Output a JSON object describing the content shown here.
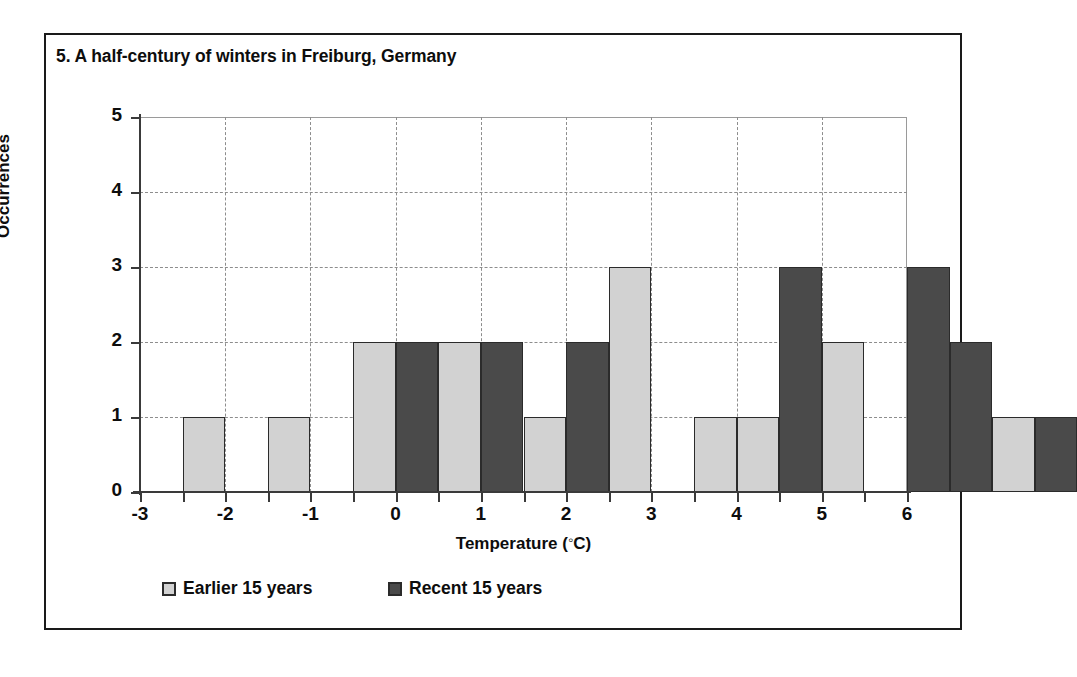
{
  "figure": {
    "title": "5.  A half-century of winters in Freiburg, Germany"
  },
  "legend": {
    "items": [
      {
        "label": "Earlier 15 years",
        "key": "earlier",
        "color": "#d2d2d2"
      },
      {
        "label": "Recent 15 years",
        "key": "recent",
        "color": "#4a4a4a"
      }
    ]
  },
  "chart_data": {
    "type": "bar",
    "title": "5.  A half-century of winters in Freiburg, Germany",
    "xlabel": "Temperature (°C)",
    "ylabel": "Occurrences",
    "xlim": [
      -3,
      6
    ],
    "ylim": [
      0,
      5
    ],
    "grid": true,
    "legend_position": "bottom",
    "bar_width": 0.5,
    "xticks": [
      -3,
      -2,
      -1,
      0,
      1,
      2,
      3,
      4,
      5,
      6
    ],
    "xticklabels": [
      "-3",
      "-2",
      "-1",
      "0",
      "1",
      "2",
      "3",
      "4",
      "5",
      "6"
    ],
    "xticks_minor": [
      -2.5,
      -1.5,
      -0.5,
      0.5,
      1.5,
      2.5,
      3.5,
      4.5,
      5.5
    ],
    "yticks": [
      0,
      1,
      2,
      3,
      4,
      5
    ],
    "yticklabels": [
      "0",
      "1",
      "2",
      "3",
      "4",
      "5"
    ],
    "series": [
      {
        "name": "Earlier 15 years",
        "color": "#d2d2d2",
        "bars": [
          {
            "x": 0.5,
            "value": 1
          },
          {
            "x": 1.0,
            "value": 1
          },
          {
            "x": 1.5,
            "value": 2
          },
          {
            "x": 2.0,
            "value": 2
          },
          {
            "x": 2.5,
            "value": 1
          },
          {
            "x": 3.0,
            "value": 3
          },
          {
            "x": 3.5,
            "value": 1
          },
          {
            "x": 4.0,
            "value": 1
          },
          {
            "x": 4.5,
            "value": 2
          },
          {
            "x": 5.5,
            "value": 1
          }
        ]
      },
      {
        "name": "Recent 15 years",
        "color": "#4a4a4a",
        "bars": [
          {
            "x": 1.5,
            "value": 2
          },
          {
            "x": 2.0,
            "value": 2
          },
          {
            "x": 2.5,
            "value": 2
          },
          {
            "x": 4.0,
            "value": 3
          },
          {
            "x": 5.0,
            "value": 3
          },
          {
            "x": 5.5,
            "value": 2
          },
          {
            "x": 6.0,
            "value": 1
          }
        ]
      }
    ],
    "bars_ordered": [
      {
        "left": 0.5,
        "width": 0.5,
        "value": 1,
        "series": "earlier"
      },
      {
        "left": 1.5,
        "width": 0.5,
        "value": 1,
        "series": "earlier"
      },
      {
        "left": 2.5,
        "width": 0.5,
        "value": 2,
        "series": "earlier"
      },
      {
        "left": 3.0,
        "width": 0.5,
        "value": 2,
        "series": "recent"
      },
      {
        "left": 3.5,
        "width": 0.5,
        "value": 2,
        "series": "earlier"
      },
      {
        "left": 4.0,
        "width": 0.5,
        "value": 2,
        "series": "recent"
      },
      {
        "left": 4.5,
        "width": 0.5,
        "value": 1,
        "series": "earlier"
      },
      {
        "left": 5.0,
        "width": 0.5,
        "value": 2,
        "series": "recent"
      },
      {
        "left": 5.5,
        "width": 0.5,
        "value": 3,
        "series": "earlier"
      },
      {
        "left": 6.5,
        "width": 0.5,
        "value": 1,
        "series": "earlier"
      },
      {
        "left": 7.0,
        "width": 0.5,
        "value": 1,
        "series": "earlier"
      },
      {
        "left": 7.5,
        "width": 0.5,
        "value": 3,
        "series": "recent"
      },
      {
        "left": 8.0,
        "width": 0.5,
        "value": 2,
        "series": "earlier"
      },
      {
        "left": 9.0,
        "width": 0.5,
        "value": 3,
        "series": "recent"
      },
      {
        "left": 9.5,
        "width": 0.5,
        "value": 2,
        "series": "recent"
      },
      {
        "left": 10.0,
        "width": 0.5,
        "value": 1,
        "series": "earlier"
      },
      {
        "left": 10.5,
        "width": 0.5,
        "value": 1,
        "series": "recent"
      }
    ]
  }
}
